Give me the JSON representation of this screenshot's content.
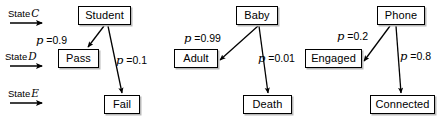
{
  "figure": {
    "title": "",
    "background": "#ffffff",
    "ink": "#000000",
    "width": 440,
    "height": 121
  },
  "state_markers": [
    {
      "id": "state-c",
      "label": "State",
      "symbol": "C",
      "x": 8,
      "y": 8,
      "arrow": {
        "x1": 10,
        "y1": 23,
        "x2": 42,
        "y2": 23
      }
    },
    {
      "id": "state-d",
      "label": "State",
      "symbol": "D",
      "x": 5,
      "y": 51,
      "arrow": {
        "x1": 10,
        "y1": 66,
        "x2": 42,
        "y2": 66
      }
    },
    {
      "id": "state-e",
      "label": "State",
      "symbol": "E",
      "x": 8,
      "y": 88,
      "arrow": {
        "x1": 10,
        "y1": 103,
        "x2": 42,
        "y2": 103
      }
    }
  ],
  "nodes": [
    {
      "id": "student",
      "label": "Student",
      "x": 78,
      "y": 6,
      "w": 53,
      "h": 19
    },
    {
      "id": "pass",
      "label": "Pass",
      "x": 58,
      "y": 49,
      "w": 41,
      "h": 19
    },
    {
      "id": "fail",
      "label": "Fail",
      "x": 104,
      "y": 95,
      "w": 36,
      "h": 19
    },
    {
      "id": "baby",
      "label": "Baby",
      "x": 236,
      "y": 6,
      "w": 42,
      "h": 19
    },
    {
      "id": "adult",
      "label": "Adult",
      "x": 174,
      "y": 49,
      "w": 44,
      "h": 19
    },
    {
      "id": "death",
      "label": "Death",
      "x": 243,
      "y": 95,
      "w": 49,
      "h": 19
    },
    {
      "id": "phone",
      "label": "Phone",
      "x": 377,
      "y": 6,
      "w": 48,
      "h": 19
    },
    {
      "id": "engaged",
      "label": "Engaged",
      "x": 305,
      "y": 49,
      "w": 57,
      "h": 19
    },
    {
      "id": "connected",
      "label": "Connected",
      "x": 370,
      "y": 95,
      "w": 65,
      "h": 19
    }
  ],
  "edges": [
    {
      "id": "student-pass",
      "from": "Student",
      "to": "Pass",
      "x1": 104,
      "y1": 26,
      "x2": 88,
      "y2": 47
    },
    {
      "id": "student-fail",
      "from": "Student",
      "to": "Fail",
      "x1": 108,
      "y1": 26,
      "x2": 122,
      "y2": 93
    },
    {
      "id": "baby-adult",
      "from": "Baby",
      "to": "Adult",
      "x1": 258,
      "y1": 26,
      "x2": 220,
      "y2": 60
    },
    {
      "id": "baby-death",
      "from": "Baby",
      "to": "Death",
      "x1": 259,
      "y1": 26,
      "x2": 268,
      "y2": 93
    },
    {
      "id": "phone-engaged",
      "from": "Phone",
      "to": "Engaged",
      "x1": 390,
      "y1": 26,
      "x2": 364,
      "y2": 61
    },
    {
      "id": "phone-connected",
      "from": "Phone",
      "to": "Connected",
      "x1": 396,
      "y1": 26,
      "x2": 401,
      "y2": 93
    }
  ],
  "probability_labels": [
    {
      "id": "p-student-pass",
      "edge": "student-pass",
      "symbol": "p",
      "equals": "=",
      "value": "0.9",
      "text": "p = 0.9",
      "x": 36,
      "y": 35
    },
    {
      "id": "p-student-fail",
      "edge": "student-fail",
      "symbol": "p",
      "equals": "=",
      "value": "0.1",
      "text": "p = 0.1",
      "x": 116,
      "y": 55
    },
    {
      "id": "p-baby-adult",
      "edge": "baby-adult",
      "symbol": "p",
      "equals": "=",
      "value": "0.99",
      "text": "p = 0.99",
      "x": 184,
      "y": 33
    },
    {
      "id": "p-baby-death",
      "edge": "baby-death",
      "symbol": "p",
      "equals": "=",
      "value": "0.01",
      "text": "p = 0.01",
      "x": 258,
      "y": 53
    },
    {
      "id": "p-phone-engaged",
      "edge": "phone-engaged",
      "symbol": "p",
      "equals": "=",
      "value": "0.2",
      "text": "p = 0.2",
      "x": 337,
      "y": 31
    },
    {
      "id": "p-phone-connected",
      "edge": "phone-connected",
      "symbol": "p",
      "equals": "=",
      "value": "0.8",
      "text": "p = 0.8",
      "x": 400,
      "y": 51
    }
  ]
}
